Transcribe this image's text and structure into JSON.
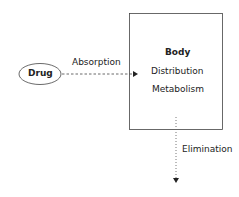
{
  "diagram": {
    "nodes": {
      "drug": {
        "label": "Drug",
        "shape": "ellipse"
      },
      "body": {
        "title": "Body",
        "lines": [
          "Distribution",
          "Metabolism"
        ],
        "shape": "rectangle"
      }
    },
    "edges": {
      "absorption": {
        "label": "Absorption",
        "from": "drug",
        "to": "body",
        "style": "dashed"
      },
      "elimination": {
        "label": "Elimination",
        "from": "body",
        "to": "out",
        "style": "dotted"
      }
    },
    "colors": {
      "stroke": "#333333",
      "text": "#222222",
      "background": "#ffffff"
    }
  }
}
